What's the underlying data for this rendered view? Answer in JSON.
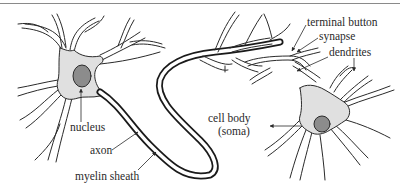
{
  "diagram": {
    "colors": {
      "background": "#ffffff",
      "soma_fill": "#e0e0e0",
      "nucleus_fill": "#8c8c8c",
      "outline": "#2a2a2a",
      "myelin": "#1a1a1a",
      "top_rule": "#8a8a8a"
    },
    "labels": {
      "nucleus": "nucleus",
      "axon": "axon",
      "myelin_sheath": "myelin sheath",
      "terminal_button": "terminal button",
      "synapse": "synapse",
      "dendrites": "dendrites",
      "cell_body_line1": "cell body",
      "cell_body_line2": "(soma)"
    },
    "nodes": [
      {
        "id": "neuron-left",
        "parts": [
          "dendrites",
          "cell body",
          "nucleus",
          "axon",
          "myelin sheath"
        ]
      },
      {
        "id": "neuron-right",
        "parts": [
          "dendrites",
          "cell body (soma)",
          "nucleus",
          "terminal button",
          "synapse"
        ]
      }
    ],
    "edges": [
      {
        "from": "neuron-left",
        "to": "neuron-right",
        "label": "synapse"
      }
    ]
  }
}
